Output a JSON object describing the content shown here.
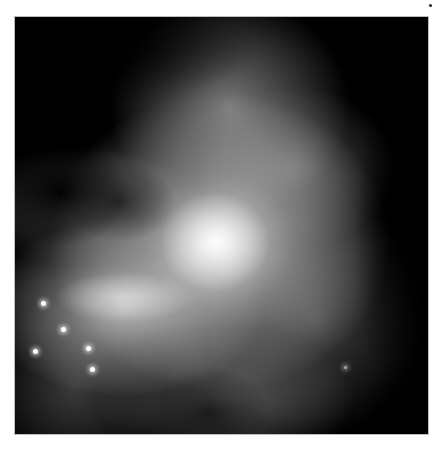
{
  "image": {
    "subject": "Grayscale astronomical photograph of a nebula",
    "alt": "Black-and-white image of a bright emission nebula with dark dust lanes and a few bright stars in the lower left"
  },
  "stars": [
    {
      "x": 20,
      "y": 334
    },
    {
      "x": 48,
      "y": 312
    },
    {
      "x": 73,
      "y": 331
    },
    {
      "x": 77,
      "y": 352
    },
    {
      "x": 28,
      "y": 286
    },
    {
      "x": 331,
      "y": 351
    }
  ]
}
